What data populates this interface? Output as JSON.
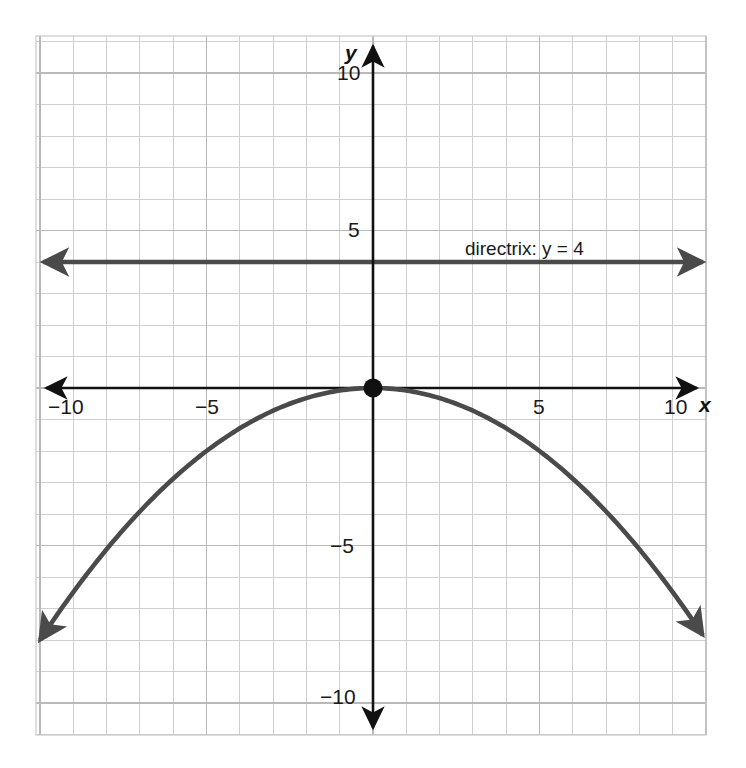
{
  "figure": {
    "background_color": "#ffffff",
    "grid_color": "#cccccc",
    "axis_color": "#111111",
    "curve_color": "#4a4a4a",
    "directrix_color": "#4a4a4a",
    "point_color": "#111111"
  },
  "axes": {
    "x_axis_name": "x",
    "y_axis_name": "y",
    "x_tick_labels": [
      "−10",
      "−5",
      "5",
      "10"
    ],
    "y_tick_labels": [
      "10",
      "5",
      "−5",
      "−10"
    ]
  },
  "annotations": {
    "directrix_label": "directrix: y = 4"
  },
  "chart_data": {
    "type": "line",
    "title": "",
    "xlabel": "x",
    "ylabel": "y",
    "xlim": [
      -10.1,
      10.1
    ],
    "ylim": [
      -11.3,
      11.0
    ],
    "grid": true,
    "grid_step": 1,
    "major_tick_step": 5,
    "legend": "none",
    "series": [
      {
        "name": "parabola",
        "type": "parabola",
        "equation": "y = -x^2/12.5",
        "vertex": [
          0,
          0
        ],
        "opens": "down",
        "a": -0.08,
        "arrow_both_ends": true,
        "x_range": [
          -10.0,
          9.9
        ],
        "points": [
          [
            -10.0,
            -8.0
          ],
          [
            -9.0,
            -6.48
          ],
          [
            -8.0,
            -5.12
          ],
          [
            -7.0,
            -3.92
          ],
          [
            -6.0,
            -2.88
          ],
          [
            -5.0,
            -2.0
          ],
          [
            -4.0,
            -1.28
          ],
          [
            -3.0,
            -0.72
          ],
          [
            -2.0,
            -0.32
          ],
          [
            -1.0,
            -0.08
          ],
          [
            0.0,
            0.0
          ],
          [
            1.0,
            -0.08
          ],
          [
            2.0,
            -0.32
          ],
          [
            3.0,
            -0.72
          ],
          [
            4.0,
            -1.28
          ],
          [
            5.0,
            -2.0
          ],
          [
            6.0,
            -2.88
          ],
          [
            7.0,
            -3.92
          ],
          [
            8.0,
            -5.12
          ],
          [
            9.0,
            -6.48
          ],
          [
            9.9,
            -7.84
          ]
        ]
      },
      {
        "name": "directrix",
        "type": "horizontal-line",
        "y": 4,
        "arrow_both_ends": true,
        "x_range": [
          -9.9,
          9.9
        ]
      }
    ],
    "markers": [
      {
        "name": "vertex",
        "x": 0,
        "y": 0,
        "style": "filled-circle"
      }
    ],
    "x_ticks": [
      -10,
      -5,
      5,
      10
    ],
    "y_ticks": [
      10,
      5,
      -5,
      -10
    ]
  }
}
